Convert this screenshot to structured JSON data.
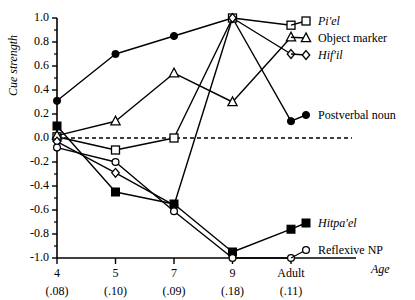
{
  "chart_data": {
    "type": "line",
    "title": "",
    "xlabel": "Age",
    "ylabel": "Cue strength",
    "categories": [
      "4",
      "5",
      "7",
      "9",
      "Adult"
    ],
    "category_sub": [
      "(.08)",
      "(.10)",
      "(.09)",
      "(.18)",
      "(.11)"
    ],
    "ylim": [
      -1.0,
      1.0
    ],
    "yticks": [
      "1.0",
      "0.8",
      "0.6",
      "0.4",
      "0.2",
      "0.0",
      "-0.2",
      "-0.4",
      "-0.6",
      "-0.8",
      "-1.0"
    ],
    "ytick_values": [
      1.0,
      0.8,
      0.6,
      0.4,
      0.2,
      0.0,
      -0.2,
      -0.4,
      -0.6,
      -0.8,
      -1.0
    ],
    "grid": false,
    "legend_position": "right",
    "zero_reference_line": 0.0,
    "series": [
      {
        "name": "Postverbal noun",
        "marker": "filled-circle",
        "label_italic": false,
        "values": [
          0.31,
          0.7,
          0.85,
          1.0,
          0.14
        ]
      },
      {
        "name": "Pi'el",
        "marker": "open-square",
        "label_italic": true,
        "values": [
          0.01,
          -0.1,
          0.0,
          1.0,
          0.94
        ]
      },
      {
        "name": "Object marker",
        "marker": "open-triangle",
        "label_italic": false,
        "values": [
          0.02,
          0.14,
          0.54,
          0.3,
          0.84
        ]
      },
      {
        "name": "Hif'il",
        "marker": "open-diamond",
        "label_italic": true,
        "values": [
          -0.03,
          -0.29,
          -0.56,
          1.0,
          0.7
        ]
      },
      {
        "name": "Hitpa'el",
        "marker": "filled-square",
        "label_italic": true,
        "values": [
          0.1,
          -0.45,
          -0.55,
          -0.95,
          -0.76
        ]
      },
      {
        "name": "Reflexive NP",
        "marker": "open-circle",
        "label_italic": false,
        "values": [
          -0.08,
          -0.2,
          -0.61,
          -1.0,
          -1.0
        ]
      }
    ]
  }
}
